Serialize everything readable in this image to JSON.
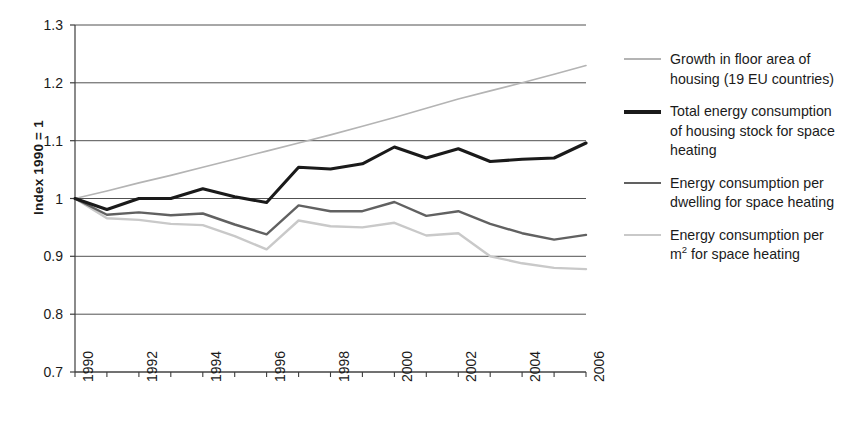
{
  "chart_data": {
    "type": "line",
    "title": "",
    "xlabel": "",
    "ylabel": "Index 1990 = 1",
    "xlim": [
      1990,
      2006
    ],
    "ylim": [
      0.7,
      1.3
    ],
    "yticks": [
      "1.3",
      "1.2",
      "1.1",
      "1",
      "0.9",
      "0.8",
      "0.7"
    ],
    "ytick_values": [
      1.3,
      1.2,
      1.1,
      1.0,
      0.9,
      0.8,
      0.7
    ],
    "xticks": [
      "1990",
      "1992",
      "1994",
      "1996",
      "1998",
      "2000",
      "2002",
      "2004",
      "2006"
    ],
    "xtick_values": [
      1990,
      1992,
      1994,
      1996,
      1998,
      2000,
      2002,
      2004,
      2006
    ],
    "x": [
      1990,
      1991,
      1992,
      1993,
      1994,
      1995,
      1996,
      1997,
      1998,
      1999,
      2000,
      2001,
      2002,
      2003,
      2004,
      2005,
      2006
    ],
    "grid": "horizontal",
    "legend_position": "right",
    "series": [
      {
        "name": "Growth in floor area of housing (19 EU countries)",
        "color": "#b4b4b4",
        "width": 1.6,
        "values": [
          1.0,
          1.013,
          1.027,
          1.04,
          1.054,
          1.068,
          1.082,
          1.096,
          1.11,
          1.125,
          1.14,
          1.156,
          1.172,
          1.186,
          1.2,
          1.215,
          1.23
        ]
      },
      {
        "name": "Total energy consumption of housing stock for space heating",
        "color": "#1a1a1a",
        "width": 3.1,
        "values": [
          1.0,
          0.981,
          1.0,
          1.0,
          1.017,
          1.003,
          0.993,
          1.054,
          1.051,
          1.06,
          1.089,
          1.07,
          1.086,
          1.064,
          1.068,
          1.07,
          1.096
        ]
      },
      {
        "name": "Energy consumption per dwelling for space heating",
        "color": "#616161",
        "width": 2.4,
        "values": [
          1.0,
          0.972,
          0.976,
          0.971,
          0.974,
          0.955,
          0.938,
          0.988,
          0.978,
          0.978,
          0.994,
          0.97,
          0.978,
          0.956,
          0.94,
          0.929,
          0.937
        ]
      },
      {
        "name": "Energy consumption per m² for space heating",
        "color": "#c9c9c9",
        "width": 2.4,
        "values": [
          1.0,
          0.966,
          0.963,
          0.956,
          0.954,
          0.935,
          0.912,
          0.962,
          0.952,
          0.95,
          0.958,
          0.936,
          0.94,
          0.9,
          0.888,
          0.88,
          0.878
        ]
      }
    ]
  },
  "legend": {
    "entries": [
      {
        "label": "Growth in floor area of\nhousing (19 EU countries)",
        "color": "#b4b4b4",
        "thickness": "2px"
      },
      {
        "label": "Total energy consumption\nof housing stock for space\nheating",
        "color": "#1a1a1a",
        "thickness": "4px"
      },
      {
        "label": "Energy consumption per\ndwelling for space heating",
        "color": "#616161",
        "thickness": "2.5px"
      },
      {
        "label": "Energy consumption per\nm² for space heating",
        "color": "#c9c9c9",
        "thickness": "2.5px"
      }
    ]
  },
  "caption": {
    "text": ""
  }
}
